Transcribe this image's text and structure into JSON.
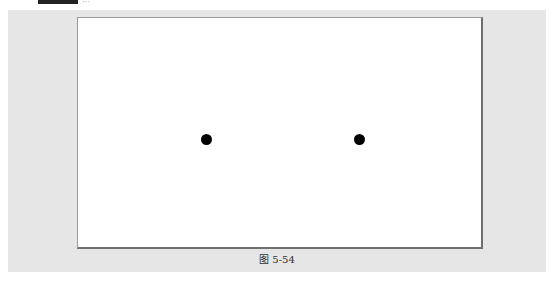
{
  "header": {
    "truncated_text": "…"
  },
  "figure": {
    "caption": "图 5-54",
    "dots": [
      {
        "cx": 201,
        "cy": 131,
        "color": "#000000"
      },
      {
        "cx": 354,
        "cy": 131,
        "color": "#000000"
      }
    ]
  }
}
